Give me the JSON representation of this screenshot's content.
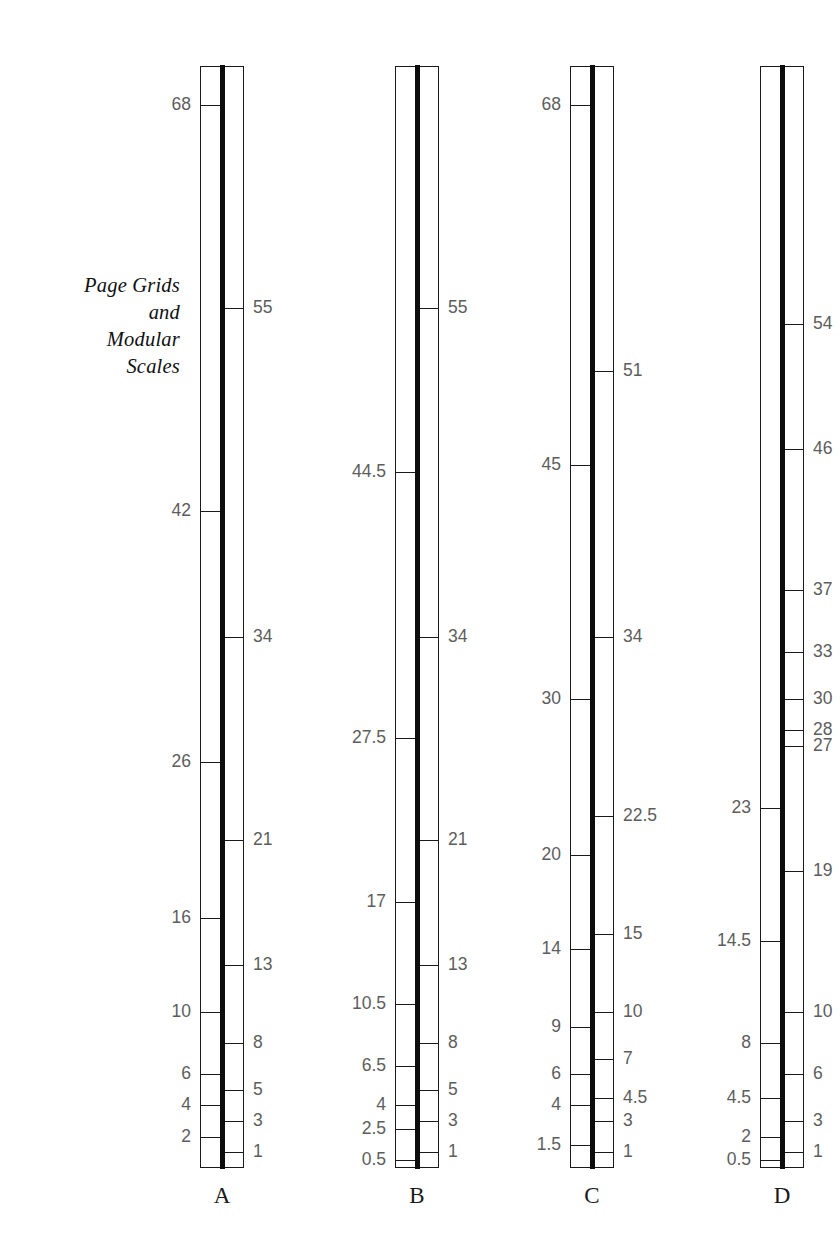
{
  "caption": {
    "lines": [
      "Page Grids",
      "and",
      "Modular",
      "Scales"
    ]
  },
  "colors": {
    "rule": "#0d0d0d",
    "outline": "#1a1a1a",
    "tick_label": "#5d5d5d",
    "background": "#ffffff"
  },
  "geometry": {
    "top_y": 66,
    "bottom_y": 1168,
    "zero_value": 0,
    "max_value": 70.5,
    "column_x": [
      200,
      395,
      570,
      760
    ],
    "column_width": 44
  },
  "chart_data": {
    "type": "table",
    "title": "Page Grids and Modular Scales",
    "xlabel": "",
    "ylabel": "",
    "axis_min": 0,
    "axis_max": 70.5,
    "grid": false,
    "legend": "none",
    "columns": [
      {
        "label": "A",
        "left_ticks": [
          68,
          42,
          26,
          16,
          10,
          6,
          4,
          2
        ],
        "right_ticks": [
          55,
          34,
          21,
          13,
          8,
          5,
          3,
          1
        ]
      },
      {
        "label": "B",
        "left_ticks": [
          44.5,
          27.5,
          17,
          10.5,
          6.5,
          4,
          2.5,
          0.5
        ],
        "right_ticks": [
          55,
          34,
          21,
          13,
          8,
          5,
          3,
          1
        ]
      },
      {
        "label": "C",
        "left_ticks": [
          68,
          45,
          30,
          20,
          14,
          9,
          6,
          4,
          1.5
        ],
        "right_ticks": [
          51,
          34,
          22.5,
          15,
          10,
          7,
          4.5,
          3,
          1
        ]
      },
      {
        "label": "D",
        "left_ticks": [
          23,
          14.5,
          8,
          4.5,
          2,
          0.5
        ],
        "right_ticks": [
          54,
          46,
          37,
          33,
          30,
          28,
          27,
          19,
          10,
          6,
          3,
          1
        ]
      }
    ]
  }
}
